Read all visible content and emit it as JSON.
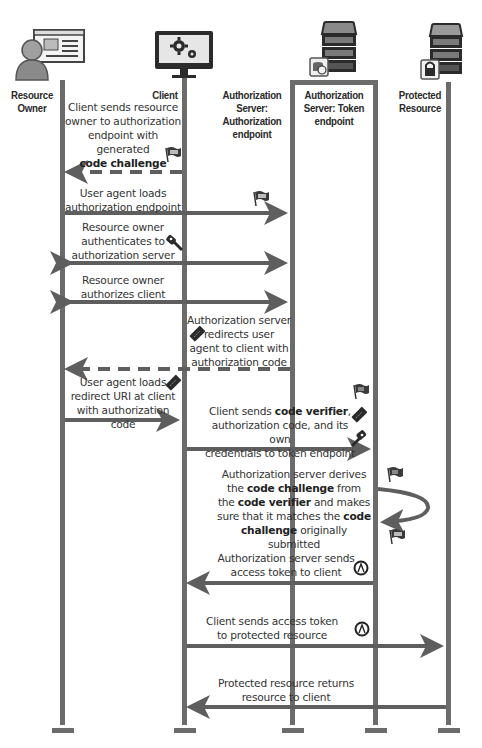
{
  "diagram": {
    "type": "sequence",
    "colors": {
      "line": "#6b6b6b",
      "arrow": "#5e5e5e",
      "icon_dark": "#2b2b2b",
      "screen_bg": "#e8e8e8",
      "server_slot": "#8a8a8a"
    },
    "actors": [
      {
        "id": "resource_owner",
        "label_line1": "Resource",
        "label_line2": "Owner",
        "icon": "person-with-browser-icon"
      },
      {
        "id": "client",
        "label_line1": "Client",
        "icon": "monitor-gears-icon"
      },
      {
        "id": "auth_endpoint",
        "label_line1": "Authorization",
        "label_line2": "Server:",
        "label_line3": "Authorization",
        "label_line4": "endpoint",
        "icon": "none"
      },
      {
        "id": "token_endpoint",
        "label_line1": "Authorization",
        "label_line2": "Server: Token",
        "label_line3": "endpoint",
        "icon": "server-database-icon"
      },
      {
        "id": "protected_resource",
        "label_line1": "Protected",
        "label_line2": "Resource",
        "icon": "server-lock-icon"
      }
    ],
    "messages": [
      {
        "from": "client",
        "to": "resource_owner",
        "style": "dashed",
        "l1": "Client sends resource",
        "l2": "owner to authorization",
        "l3": "endpoint with",
        "l4": "generated",
        "bold": "code challenge",
        "icon": "flag-icon"
      },
      {
        "from": "resource_owner",
        "to": "auth_endpoint",
        "style": "solid",
        "l1": "User agent loads",
        "l2": "authorization endpoint",
        "icon": "flag-icon"
      },
      {
        "from": "resource_owner",
        "to": "auth_endpoint",
        "style": "bidirectional",
        "l1": "Resource owner",
        "l2": "authenticates to",
        "l3": "authorization server",
        "icon": "key-icon"
      },
      {
        "from": "resource_owner",
        "to": "auth_endpoint",
        "style": "bidirectional",
        "l1": "Resource owner",
        "l2": "authorizes client"
      },
      {
        "from": "auth_endpoint",
        "to": "resource_owner",
        "style": "dashed",
        "l1": "Authorization server",
        "l2": "redirects user",
        "l3": "agent to client with",
        "l4": "authorization code",
        "icon": "ticket-icon"
      },
      {
        "from": "resource_owner",
        "to": "client",
        "style": "solid",
        "l1": "User agent loads",
        "l2": "redirect URI at client",
        "l3": "with authorization code",
        "icon": "ticket-icon"
      },
      {
        "from": "client",
        "to": "token_endpoint",
        "style": "solid",
        "pre": "Client sends ",
        "bold": "code verifier",
        "post": ",",
        "l2": "authorization code, and its own",
        "l3": "credentials to token endpoint",
        "icons": [
          "flag-icon",
          "ticket-icon",
          "key-icon"
        ]
      },
      {
        "from": "token_endpoint",
        "to": "token_endpoint",
        "style": "self",
        "l1": "Authorization server derives",
        "l2_pre": "the ",
        "l2_bold": "code challenge",
        "l2_post": " from",
        "l3_pre": "the ",
        "l3_bold": "code verifier",
        "l3_post": " and makes",
        "l4_pre": "sure that it matches the ",
        "l4_bold": "code",
        "l5_bold": "challenge",
        "l5_post": " originally submitted",
        "icons": [
          "flag-icon",
          "flag-icon"
        ]
      },
      {
        "from": "token_endpoint",
        "to": "client",
        "style": "solid",
        "l1": "Authorization server sends",
        "l2": "access token to client",
        "icon": "access-token-icon",
        "token_glyph": "A"
      },
      {
        "from": "client",
        "to": "protected_resource",
        "style": "solid",
        "l1": "Client sends access token",
        "l2": "to protected resource",
        "icon": "access-token-icon",
        "token_glyph": "A"
      },
      {
        "from": "protected_resource",
        "to": "client",
        "style": "solid",
        "l1": "Protected resource returns",
        "l2": "resource to client"
      }
    ]
  }
}
